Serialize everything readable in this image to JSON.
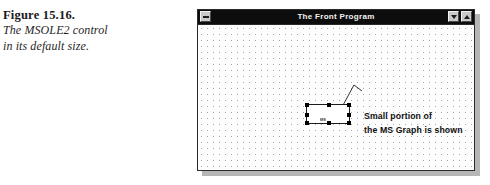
{
  "figure": {
    "number": "Figure 15.16.",
    "description_lines": [
      "The MSOLE2 control",
      "in its default size."
    ]
  },
  "window": {
    "title": "The Front Program",
    "system_menu_icon": "window-menu-bar-icon",
    "minimize_icon": "triangle-down-icon",
    "maximize_icon": "triangle-up-icon",
    "title_bar_color": "#0d0d0d",
    "title_text_color": "#f2f2f2",
    "client_background": "#fdfdfd",
    "grid_dot_color": "#a8a8a8"
  },
  "ole_control": {
    "name": "MSOLE2",
    "state": "selected",
    "embedded_label": "MS",
    "border_color": "#1c1c1c",
    "handle_color": "#000000",
    "handles": [
      "top-left",
      "top-middle",
      "top-right",
      "middle-left",
      "middle-right",
      "bottom-left",
      "bottom-middle",
      "bottom-right"
    ]
  },
  "annotation": {
    "lines": [
      "Small portion of",
      "the MS Graph is shown"
    ],
    "leader_line_color": "#1c1c1c"
  }
}
